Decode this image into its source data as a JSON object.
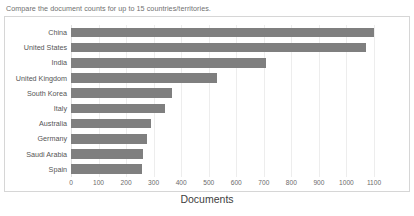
{
  "caption": "Compare the document counts for up to 15 countries/territories.",
  "chart_data": {
    "type": "bar",
    "orientation": "horizontal",
    "title": "",
    "xlabel": "Documents",
    "ylabel": "",
    "categories": [
      "China",
      "United States",
      "India",
      "United Kingdom",
      "South Korea",
      "Italy",
      "Australia",
      "Germany",
      "Saudi Arabia",
      "Spain"
    ],
    "values": [
      1100,
      1072,
      708,
      530,
      366,
      340,
      292,
      277,
      262,
      258
    ],
    "xticks": [
      0,
      100,
      200,
      300,
      400,
      500,
      600,
      700,
      800,
      900,
      1000,
      1100
    ],
    "xticklabels": [
      "0",
      "100",
      "200",
      "300",
      "400",
      "500",
      "600",
      "700",
      "800",
      "900",
      "1000",
      "1100"
    ],
    "xlim": [
      0,
      1100
    ],
    "grid": true,
    "grid_axis": "x",
    "legend": false,
    "bar_color": "#7f7f7f",
    "grid_color": "#ededed",
    "frame_color": "#d6d6d6"
  }
}
